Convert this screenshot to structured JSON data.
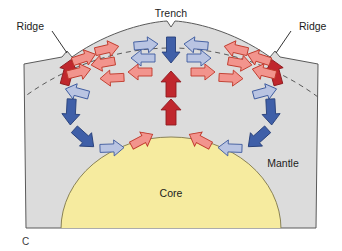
{
  "figure": {
    "panel_letter": "C",
    "labels": {
      "trench": "Trench",
      "ridge_left": "Ridge",
      "ridge_right": "Ridge",
      "mantle": "Mantle",
      "core": "Core"
    }
  },
  "colors": {
    "mantle_fill": "#dcdcdc",
    "core_fill": "#f6eb9f",
    "outline": "#5a5a5a",
    "core_outline": "#8a8255",
    "arrow_red_pale_fill": "#f2948d",
    "arrow_red_pale_stroke": "#c0392b",
    "arrow_red_dark_fill": "#c0272d",
    "arrow_red_dark_stroke": "#8e1b20",
    "arrow_blue_pale_fill": "#b9c4e2",
    "arrow_blue_pale_stroke": "#3d5a9e",
    "arrow_blue_dark_fill": "#3f5fa8",
    "arrow_blue_dark_stroke": "#27407a",
    "dashed_line": "#5a5a5a",
    "text": "#1c1c1c",
    "background": "#ffffff"
  },
  "diagram": {
    "type": "earth-cross-section-mantle-convection",
    "leader_lines": [
      {
        "name": "ridge-left-leader",
        "from": [
          52,
          30
        ],
        "to": [
          72,
          55
        ]
      },
      {
        "name": "ridge-right-leader",
        "from": [
          290,
          30
        ],
        "to": [
          270,
          55
        ]
      }
    ],
    "arrows": [
      {
        "name": "arrow-ridge-left-upwell",
        "color": "red_dark",
        "x": 68,
        "y": 72,
        "angle": -75,
        "len": 26,
        "w": 9
      },
      {
        "name": "arrow-ridge-right-upwell",
        "color": "red_dark",
        "x": 275,
        "y": 72,
        "angle": -105,
        "len": 26,
        "w": 9
      },
      {
        "name": "arrow-top-left-a",
        "color": "red_pale",
        "x": 84,
        "y": 58,
        "angle": -18,
        "len": 24,
        "w": 8
      },
      {
        "name": "arrow-top-left-b",
        "color": "red_pale",
        "x": 79,
        "y": 72,
        "angle": -14,
        "len": 24,
        "w": 8
      },
      {
        "name": "arrow-top-left-c",
        "color": "red_pale",
        "x": 107,
        "y": 49,
        "angle": -13,
        "len": 24,
        "w": 8
      },
      {
        "name": "arrow-top-left-d",
        "color": "red_pale",
        "x": 103,
        "y": 63,
        "angle": 170,
        "len": 24,
        "w": 8
      },
      {
        "name": "arrow-top-left-e",
        "color": "red_pale",
        "x": 112,
        "y": 78,
        "angle": 177,
        "len": 24,
        "w": 8
      },
      {
        "name": "arrow-top-left-f",
        "color": "red_pale",
        "x": 140,
        "y": 72,
        "angle": 180,
        "len": 24,
        "w": 8
      },
      {
        "name": "arrow-top-blue-left-a",
        "color": "blue_pale",
        "x": 146,
        "y": 45,
        "angle": -5,
        "len": 24,
        "w": 8
      },
      {
        "name": "arrow-top-blue-left-b",
        "color": "blue_pale",
        "x": 143,
        "y": 58,
        "angle": 180,
        "len": 24,
        "w": 8
      },
      {
        "name": "arrow-trench-down",
        "color": "blue_dark",
        "x": 171,
        "y": 50,
        "angle": 90,
        "len": 26,
        "w": 9
      },
      {
        "name": "arrow-top-blue-right-a",
        "color": "blue_pale",
        "x": 196,
        "y": 45,
        "angle": 185,
        "len": 24,
        "w": 8
      },
      {
        "name": "arrow-top-blue-right-b",
        "color": "blue_pale",
        "x": 199,
        "y": 58,
        "angle": 0,
        "len": 24,
        "w": 8
      },
      {
        "name": "arrow-top-right-a",
        "color": "red_pale",
        "x": 259,
        "y": 58,
        "angle": 198,
        "len": 24,
        "w": 8
      },
      {
        "name": "arrow-top-right-b",
        "color": "red_pale",
        "x": 264,
        "y": 72,
        "angle": 194,
        "len": 24,
        "w": 8
      },
      {
        "name": "arrow-top-right-c",
        "color": "red_pale",
        "x": 236,
        "y": 49,
        "angle": 193,
        "len": 24,
        "w": 8
      },
      {
        "name": "arrow-top-right-d",
        "color": "red_pale",
        "x": 240,
        "y": 63,
        "angle": 10,
        "len": 24,
        "w": 8
      },
      {
        "name": "arrow-top-right-e",
        "color": "red_pale",
        "x": 231,
        "y": 78,
        "angle": 3,
        "len": 24,
        "w": 8
      },
      {
        "name": "arrow-top-right-f",
        "color": "red_pale",
        "x": 203,
        "y": 72,
        "angle": 0,
        "len": 24,
        "w": 8
      },
      {
        "name": "arrow-mid-center-up-1",
        "color": "red_dark",
        "x": 171,
        "y": 84,
        "angle": -90,
        "len": 26,
        "w": 10
      },
      {
        "name": "arrow-mid-center-up-2",
        "color": "red_dark",
        "x": 171,
        "y": 112,
        "angle": -90,
        "len": 26,
        "w": 10
      },
      {
        "name": "arrow-left-desc-a",
        "color": "blue_pale",
        "x": 77,
        "y": 92,
        "angle": 195,
        "len": 24,
        "w": 8
      },
      {
        "name": "arrow-left-desc-b",
        "color": "blue_dark",
        "x": 71,
        "y": 112,
        "angle": 93,
        "len": 26,
        "w": 9
      },
      {
        "name": "arrow-left-desc-c",
        "color": "blue_dark",
        "x": 84,
        "y": 138,
        "angle": 42,
        "len": 26,
        "w": 9
      },
      {
        "name": "arrow-bottom-left-a",
        "color": "blue_pale",
        "x": 112,
        "y": 148,
        "angle": -2,
        "len": 24,
        "w": 8
      },
      {
        "name": "arrow-bottom-left-b",
        "color": "red_pale",
        "x": 142,
        "y": 140,
        "angle": -28,
        "len": 24,
        "w": 8
      },
      {
        "name": "arrow-right-desc-a",
        "color": "blue_pale",
        "x": 265,
        "y": 92,
        "angle": -15,
        "len": 24,
        "w": 8
      },
      {
        "name": "arrow-right-desc-b",
        "color": "blue_dark",
        "x": 271,
        "y": 112,
        "angle": 87,
        "len": 26,
        "w": 9
      },
      {
        "name": "arrow-right-desc-c",
        "color": "blue_dark",
        "x": 258,
        "y": 138,
        "angle": 138,
        "len": 26,
        "w": 9
      },
      {
        "name": "arrow-bottom-right-a",
        "color": "blue_pale",
        "x": 230,
        "y": 148,
        "angle": 182,
        "len": 24,
        "w": 8
      },
      {
        "name": "arrow-bottom-right-b",
        "color": "red_pale",
        "x": 200,
        "y": 140,
        "angle": 208,
        "len": 24,
        "w": 8
      }
    ]
  }
}
